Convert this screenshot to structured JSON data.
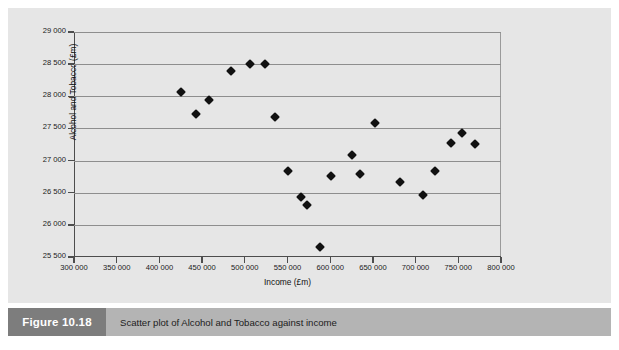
{
  "figure": {
    "number_label": "Figure 10.18",
    "caption": "Scatter plot of Alcohol and Tobacco against income"
  },
  "colors": {
    "plate_background": "#e6e6e6",
    "caption_band": "#b4b4b4",
    "caption_figno_box": "#7d7d7d",
    "axis": "#4d4d4d",
    "gridline": "#8e8e8e",
    "marker": "#111111",
    "page_background": "#ffffff"
  },
  "chart_data": {
    "type": "scatter",
    "title": "",
    "xlabel": "Income (£m)",
    "ylabel": "Alcohol and Tobacco (£m)",
    "xlim": [
      300000,
      800000
    ],
    "ylim": [
      25500,
      29000
    ],
    "xticks": [
      300000,
      350000,
      400000,
      450000,
      500000,
      550000,
      600000,
      650000,
      700000,
      750000,
      800000
    ],
    "xticklabels": [
      "300 000",
      "350 000",
      "400 000",
      "450 000",
      "500 000",
      "550 000",
      "600 000",
      "650 000",
      "700 000",
      "750 000",
      "800 000"
    ],
    "yticks": [
      25500,
      26000,
      26500,
      27000,
      27500,
      28000,
      28500,
      29000
    ],
    "yticklabels": [
      "25 500",
      "26 000",
      "26 500",
      "27 000",
      "27 500",
      "28 000",
      "28 500",
      "29 000"
    ],
    "grid": "horizontal",
    "legend": "none",
    "marker_style": "filled-diamond",
    "series": [
      {
        "name": "Alcohol and Tobacco vs Income",
        "points": [
          {
            "x": 425000,
            "y": 28060
          },
          {
            "x": 443000,
            "y": 27720
          },
          {
            "x": 458000,
            "y": 27950
          },
          {
            "x": 484000,
            "y": 28390
          },
          {
            "x": 506000,
            "y": 28500
          },
          {
            "x": 524000,
            "y": 28495
          },
          {
            "x": 535000,
            "y": 27680
          },
          {
            "x": 551000,
            "y": 26840
          },
          {
            "x": 566000,
            "y": 26440
          },
          {
            "x": 573000,
            "y": 26310
          },
          {
            "x": 588000,
            "y": 25650
          },
          {
            "x": 601000,
            "y": 26765
          },
          {
            "x": 625000,
            "y": 27090
          },
          {
            "x": 635000,
            "y": 26795
          },
          {
            "x": 652000,
            "y": 27590
          },
          {
            "x": 682000,
            "y": 26670
          },
          {
            "x": 709000,
            "y": 26470
          },
          {
            "x": 723000,
            "y": 26845
          },
          {
            "x": 742000,
            "y": 27270
          },
          {
            "x": 754000,
            "y": 27430
          },
          {
            "x": 770000,
            "y": 27255
          }
        ]
      }
    ]
  }
}
